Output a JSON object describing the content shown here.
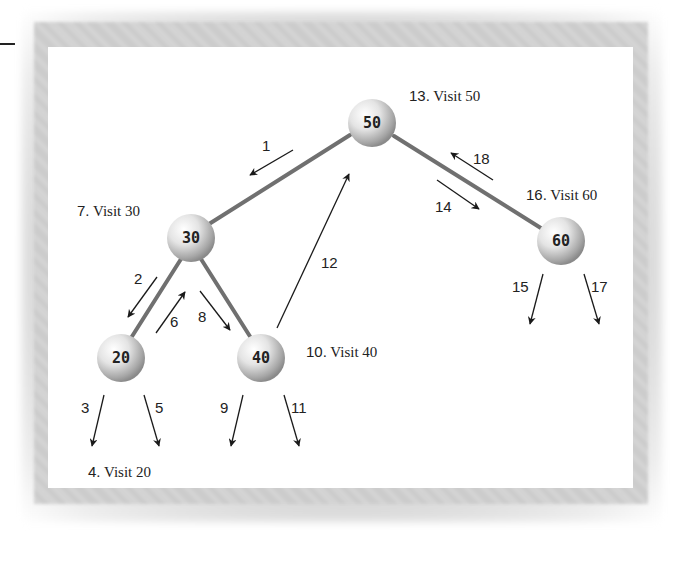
{
  "figure": {
    "colors": {
      "edge": "#707070",
      "arrow": "#1a1a1a",
      "node_light": "#ffffff",
      "node_dark": "#8a8a8a",
      "text": "#222222"
    }
  },
  "nodes": [
    {
      "id": "n50",
      "value": "50",
      "cx": 372,
      "cy": 123,
      "r": 24
    },
    {
      "id": "n30",
      "value": "30",
      "cx": 191,
      "cy": 238,
      "r": 24
    },
    {
      "id": "n60",
      "value": "60",
      "cx": 561,
      "cy": 241,
      "r": 24
    },
    {
      "id": "n20",
      "value": "20",
      "cx": 121,
      "cy": 358,
      "r": 24
    },
    {
      "id": "n40",
      "value": "40",
      "cx": 261,
      "cy": 358,
      "r": 24
    }
  ],
  "edges": [
    {
      "from": "50",
      "to": "30",
      "x1": 350,
      "y1": 135,
      "x2": 209,
      "y2": 224
    },
    {
      "from": "50",
      "to": "60",
      "x1": 394,
      "y1": 136,
      "x2": 544,
      "y2": 230
    },
    {
      "from": "30",
      "to": "20",
      "x1": 181,
      "y1": 259,
      "x2": 131,
      "y2": 338
    },
    {
      "from": "30",
      "to": "40",
      "x1": 201,
      "y1": 259,
      "x2": 251,
      "y2": 338
    }
  ],
  "steps": [
    {
      "n": "1",
      "x1": 293,
      "y1": 150,
      "x2": 250,
      "y2": 175,
      "lx": 262,
      "ly": 151
    },
    {
      "n": "2",
      "x1": 157,
      "y1": 277,
      "x2": 128,
      "y2": 317,
      "lx": 134,
      "ly": 284
    },
    {
      "n": "3",
      "x1": 104,
      "y1": 395,
      "x2": 92,
      "y2": 446,
      "lx": 81,
      "ly": 413
    },
    {
      "n": "5",
      "x1": 144,
      "y1": 395,
      "x2": 159,
      "y2": 446,
      "lx": 155,
      "ly": 413
    },
    {
      "n": "6",
      "x1": 156,
      "y1": 333,
      "x2": 185,
      "y2": 292,
      "lx": 170,
      "ly": 327
    },
    {
      "n": "8",
      "x1": 200,
      "y1": 291,
      "x2": 230,
      "y2": 330,
      "lx": 198,
      "ly": 322
    },
    {
      "n": "9",
      "x1": 243,
      "y1": 395,
      "x2": 231,
      "y2": 446,
      "lx": 220,
      "ly": 413
    },
    {
      "n": "11",
      "x1": 284,
      "y1": 395,
      "x2": 299,
      "y2": 446,
      "lx": 291,
      "ly": 413
    },
    {
      "n": "12",
      "x1": 277,
      "y1": 328,
      "x2": 349,
      "y2": 174,
      "lx": 321,
      "ly": 268
    },
    {
      "n": "14",
      "x1": 437,
      "y1": 180,
      "x2": 479,
      "y2": 209,
      "lx": 435,
      "ly": 212
    },
    {
      "n": "15",
      "x1": 543,
      "y1": 274,
      "x2": 530,
      "y2": 324,
      "lx": 512,
      "ly": 292
    },
    {
      "n": "17",
      "x1": 584,
      "y1": 274,
      "x2": 599,
      "y2": 324,
      "lx": 591,
      "ly": 292
    },
    {
      "n": "18",
      "x1": 493,
      "y1": 180,
      "x2": 451,
      "y2": 153,
      "lx": 473,
      "ly": 164
    }
  ],
  "visits": [
    {
      "order": "4.",
      "text": " Visit 20",
      "x": 88,
      "y": 477
    },
    {
      "order": "7.",
      "text": " Visit 30",
      "x": 77,
      "y": 216
    },
    {
      "order": "10.",
      "text": " Visit 40",
      "x": 306,
      "y": 357
    },
    {
      "order": "13.",
      "text": " Visit 50",
      "x": 409,
      "y": 101
    },
    {
      "order": "16.",
      "text": " Visit 60",
      "x": 526,
      "y": 200
    }
  ]
}
